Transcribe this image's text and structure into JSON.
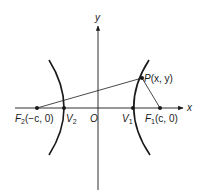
{
  "diagram": {
    "type": "hyperbola",
    "axes": {
      "x_label": "x",
      "y_label": "y",
      "origin_label": "O"
    },
    "points": {
      "P": {
        "name": "P",
        "coords": "(x, y)"
      },
      "F1": {
        "name": "F",
        "sub": "1",
        "coords": "(c, 0)"
      },
      "F2": {
        "name": "F",
        "sub": "2",
        "coords": "(−c, 0)"
      },
      "V1": {
        "name": "V",
        "sub": "1"
      },
      "V2": {
        "name": "V",
        "sub": "2"
      }
    },
    "segments": [
      "F2-P",
      "P-F1"
    ],
    "colors": {
      "ink": "#1a1a1a",
      "background": "#ffffff"
    }
  }
}
